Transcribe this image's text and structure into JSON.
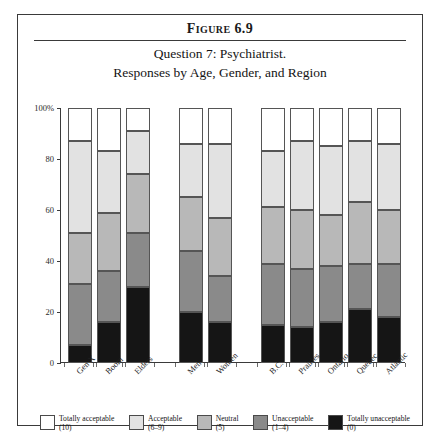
{
  "figure": {
    "number": "Figure 6.9",
    "subtitle_line1": "Question 7: Psychiatrist.",
    "subtitle_line2": "Responses by Age, Gender, and Region"
  },
  "axis": {
    "y_ticks": [
      "0",
      "20",
      "40",
      "60",
      "80",
      "100%"
    ],
    "y_min": 0,
    "y_max": 100
  },
  "legend": [
    {
      "label": "Totally acceptable",
      "range": "(10)",
      "color": "#ffffff"
    },
    {
      "label": "Acceptable",
      "range": "(6–9)",
      "color": "#e2e2e2"
    },
    {
      "label": "Neutral",
      "range": "(5)",
      "color": "#b8b8b8"
    },
    {
      "label": "Unacceptable",
      "range": "(1–4)",
      "color": "#8a8a8a"
    },
    {
      "label": "Totally unacceptable",
      "range": "(0)",
      "color": "#151515"
    }
  ],
  "chart_data": {
    "type": "bar",
    "stacked": true,
    "title": "Question 7: Psychiatrist. Responses by Age, Gender, and Region",
    "xlabel": "",
    "ylabel": "",
    "ylim": [
      0,
      100
    ],
    "grid": false,
    "legend_position": "bottom",
    "categories": [
      "Gen X",
      "Boom",
      "Elders",
      "Men",
      "Women",
      "B.C.",
      "Prairies",
      "Ontario",
      "Quebec",
      "Atlantic"
    ],
    "groups": [
      {
        "name": "Age",
        "categories": [
          "Gen X",
          "Boom",
          "Elders"
        ]
      },
      {
        "name": "Gender",
        "categories": [
          "Men",
          "Women"
        ]
      },
      {
        "name": "Region",
        "categories": [
          "B.C.",
          "Prairies",
          "Ontario",
          "Quebec",
          "Atlantic"
        ]
      }
    ],
    "series": [
      {
        "name": "Totally unacceptable",
        "color": "#151515",
        "values": [
          7,
          16,
          30,
          20,
          16,
          15,
          14,
          16,
          21,
          18
        ]
      },
      {
        "name": "Unacceptable",
        "color": "#8a8a8a",
        "values": [
          24,
          20,
          21,
          24,
          18,
          24,
          23,
          22,
          18,
          21
        ]
      },
      {
        "name": "Neutral",
        "color": "#b8b8b8",
        "values": [
          20,
          23,
          23,
          21,
          23,
          22,
          23,
          20,
          24,
          21
        ]
      },
      {
        "name": "Acceptable",
        "color": "#e2e2e2",
        "values": [
          36,
          24,
          17,
          21,
          29,
          22,
          27,
          27,
          24,
          26
        ]
      },
      {
        "name": "Totally acceptable",
        "color": "#ffffff",
        "values": [
          13,
          17,
          9,
          14,
          14,
          17,
          13,
          15,
          13,
          14
        ]
      }
    ]
  }
}
